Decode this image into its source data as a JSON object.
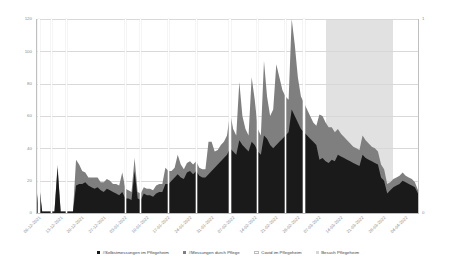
{
  "chart": {
    "type": "area",
    "title": "",
    "xlabel": "",
    "ylabel": "",
    "ylim": [
      0,
      120
    ],
    "y2lim": [
      0,
      1
    ],
    "grid": true,
    "legend_position": "bottom"
  },
  "axes": {
    "left_ticks": [
      "0",
      "20",
      "40",
      "60",
      "80",
      "100",
      "120"
    ],
    "right_ticks": [
      "0",
      "1"
    ],
    "x_ticks": [
      "06-12-2021",
      "13-12-2021",
      "20-12-2021",
      "27-12-2021",
      "03-01-2022",
      "10-01-2022",
      "17-01-2022",
      "24-01-2022",
      "31-01-2022",
      "07-02-2022",
      "14-02-2022",
      "21-02-2022",
      "28-02-2022",
      "07-03-2022",
      "14-03-2022",
      "21-03-2022",
      "28-03-2022",
      "04-04-2022"
    ]
  },
  "legend": {
    "items": [
      {
        "label": "#Selbstmessungen im Pflegeheim",
        "color": "#1a1a1a",
        "marker": "square"
      },
      {
        "label": "#Messungen durch Pflege",
        "color": "#7f7f7f",
        "marker": "square"
      },
      {
        "label": "Covid im Pflegeheim",
        "color": "#ffffff",
        "marker": "line"
      },
      {
        "label": "Besuch Pflegeheim",
        "color": "#d6d6d6",
        "marker": "square"
      }
    ]
  },
  "chart_data": {
    "type": "area",
    "title": "",
    "xlabel": "",
    "ylabel": "",
    "ylim": [
      0,
      120
    ],
    "y2lim": [
      0,
      1
    ],
    "grid": true,
    "legend_position": "bottom",
    "categories": [
      "06-12-2021",
      "07-12-2021",
      "08-12-2021",
      "09-12-2021",
      "10-12-2021",
      "11-12-2021",
      "12-12-2021",
      "13-12-2021",
      "14-12-2021",
      "15-12-2021",
      "16-12-2021",
      "17-12-2021",
      "18-12-2021",
      "19-12-2021",
      "20-12-2021",
      "21-12-2021",
      "22-12-2021",
      "23-12-2021",
      "24-12-2021",
      "25-12-2021",
      "26-12-2021",
      "27-12-2021",
      "28-12-2021",
      "29-12-2021",
      "30-12-2021",
      "31-12-2021",
      "01-01-2022",
      "02-01-2022",
      "03-01-2022",
      "04-01-2022",
      "05-01-2022",
      "06-01-2022",
      "07-01-2022",
      "08-01-2022",
      "09-01-2022",
      "10-01-2022",
      "11-01-2022",
      "12-01-2022",
      "13-01-2022",
      "14-01-2022",
      "15-01-2022",
      "16-01-2022",
      "17-01-2022",
      "18-01-2022",
      "19-01-2022",
      "20-01-2022",
      "21-01-2022",
      "22-01-2022",
      "23-01-2022",
      "24-01-2022",
      "25-01-2022",
      "26-01-2022",
      "27-01-2022",
      "28-01-2022",
      "29-01-2022",
      "30-01-2022",
      "31-01-2022",
      "01-02-2022",
      "02-02-2022",
      "03-02-2022",
      "04-02-2022",
      "05-02-2022",
      "06-02-2022",
      "07-02-2022",
      "08-02-2022",
      "09-02-2022",
      "10-02-2022",
      "11-02-2022",
      "12-02-2022",
      "13-02-2022",
      "14-02-2022",
      "15-02-2022",
      "16-02-2022",
      "17-02-2022",
      "18-02-2022",
      "19-02-2022",
      "20-02-2022",
      "21-02-2022",
      "22-02-2022",
      "23-02-2022",
      "24-02-2022",
      "25-02-2022",
      "26-02-2022",
      "27-02-2022",
      "28-02-2022",
      "01-03-2022",
      "02-03-2022",
      "03-03-2022",
      "04-03-2022",
      "05-03-2022",
      "06-03-2022",
      "07-03-2022",
      "08-03-2022",
      "09-03-2022",
      "10-03-2022",
      "11-03-2022",
      "12-03-2022",
      "13-03-2022",
      "14-03-2022",
      "15-03-2022",
      "16-03-2022",
      "17-03-2022",
      "18-03-2022",
      "19-03-2022",
      "20-03-2022",
      "21-03-2022",
      "22-03-2022",
      "23-03-2022",
      "24-03-2022",
      "25-03-2022",
      "26-03-2022",
      "27-03-2022",
      "28-03-2022",
      "29-03-2022",
      "30-03-2022",
      "31-03-2022",
      "01-04-2022",
      "02-04-2022",
      "03-04-2022",
      "04-04-2022",
      "05-04-2022",
      "06-04-2022",
      "07-04-2022",
      "08-04-2022",
      "09-04-2022"
    ],
    "series": [
      {
        "name": "#Selbstmessungen im Pflegeheim",
        "color": "#1a1a1a",
        "stack": "bottom",
        "values": [
          1,
          17,
          1,
          1,
          1,
          1,
          1,
          28,
          1,
          1,
          1,
          1,
          1,
          17,
          18,
          18,
          19,
          17,
          16,
          15,
          16,
          14,
          13,
          15,
          14,
          13,
          12,
          11,
          13,
          9,
          9,
          8,
          26,
          9,
          8,
          12,
          11,
          11,
          10,
          12,
          13,
          13,
          18,
          18,
          20,
          22,
          24,
          22,
          21,
          25,
          26,
          24,
          26,
          23,
          22,
          22,
          24,
          26,
          28,
          30,
          32,
          34,
          36,
          40,
          38,
          36,
          45,
          42,
          40,
          38,
          44,
          42,
          38,
          36,
          48,
          46,
          42,
          40,
          42,
          44,
          46,
          48,
          50,
          64,
          60,
          56,
          52,
          50,
          48,
          46,
          44,
          42,
          33,
          34,
          32,
          31,
          33,
          32,
          36,
          35,
          34,
          33,
          32,
          31,
          30,
          29,
          36,
          34,
          33,
          32,
          31,
          30,
          22,
          20,
          12,
          14,
          16,
          17,
          18,
          20,
          19,
          18,
          17,
          16,
          12
        ]
      },
      {
        "name": "#Messungen durch Pflege",
        "color": "#7f7f7f",
        "stack": "top",
        "values": [
          0,
          2,
          0,
          0,
          0,
          0,
          0,
          2,
          0,
          0,
          0,
          0,
          0,
          16,
          12,
          8,
          6,
          5,
          6,
          7,
          6,
          5,
          6,
          6,
          6,
          5,
          6,
          6,
          12,
          6,
          5,
          5,
          8,
          4,
          4,
          4,
          4,
          4,
          4,
          5,
          5,
          5,
          10,
          8,
          6,
          6,
          12,
          8,
          6,
          6,
          6,
          6,
          6,
          5,
          5,
          5,
          20,
          18,
          10,
          9,
          10,
          10,
          12,
          22,
          14,
          12,
          36,
          18,
          12,
          10,
          40,
          28,
          14,
          12,
          46,
          26,
          18,
          24,
          50,
          40,
          30,
          24,
          20,
          56,
          44,
          28,
          20,
          18,
          16,
          14,
          12,
          12,
          28,
          26,
          24,
          22,
          20,
          18,
          16,
          14,
          13,
          12,
          11,
          10,
          10,
          10,
          12,
          11,
          10,
          9,
          9,
          8,
          8,
          7,
          6,
          5,
          5,
          5,
          5,
          5,
          4,
          4,
          4,
          3,
          2
        ]
      }
    ],
    "covid_markers": {
      "name": "Covid im Pflegeheim",
      "color": "#ffffff",
      "dates": [
        "07-12-2021",
        "11-12-2021",
        "16-12-2021",
        "04-01-2022",
        "09-01-2022",
        "18-01-2022",
        "27-01-2022",
        "07-02-2022",
        "16-02-2022",
        "25-02-2022",
        "03-03-2022"
      ]
    },
    "besuch_band": {
      "name": "Besuch Pflegeheim",
      "color": "#d6d6d6",
      "value": 1,
      "start": "10-03-2022",
      "end": "01-04-2022"
    }
  }
}
